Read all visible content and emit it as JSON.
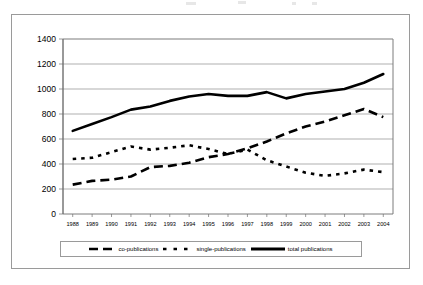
{
  "chart_data": {
    "type": "line",
    "title": "",
    "xlabel": "",
    "ylabel": "",
    "ylim": [
      0,
      1400
    ],
    "ytick_step": 200,
    "grid": true,
    "legend_position": "bottom",
    "categories": [
      "1988",
      "1989",
      "1990",
      "1991",
      "1992",
      "1993",
      "1994",
      "1995",
      "1996",
      "1997",
      "1998",
      "1999",
      "2000",
      "2001",
      "2002",
      "2003",
      "2004"
    ],
    "yticks": [
      "1400",
      "1200",
      "1000",
      "800",
      "600",
      "400",
      "200",
      "0"
    ],
    "series": [
      {
        "name": "co-publications",
        "style": "long-dash",
        "values": [
          235,
          265,
          275,
          300,
          375,
          385,
          410,
          455,
          480,
          525,
          580,
          645,
          700,
          740,
          790,
          840,
          775
        ]
      },
      {
        "name": "single-publications",
        "style": "short-dash",
        "values": [
          440,
          450,
          495,
          540,
          515,
          530,
          550,
          520,
          480,
          515,
          430,
          380,
          330,
          305,
          325,
          355,
          335
        ]
      },
      {
        "name": "total publications",
        "style": "solid",
        "values": [
          665,
          720,
          775,
          835,
          860,
          905,
          940,
          960,
          945,
          945,
          975,
          925,
          960,
          980,
          1000,
          1050,
          1120
        ]
      }
    ]
  },
  "legend": {
    "items": [
      {
        "label": "co-publications",
        "style": "long-dash"
      },
      {
        "label": "single-publications",
        "style": "short-dash"
      },
      {
        "label": "total publications",
        "style": "solid"
      }
    ]
  }
}
